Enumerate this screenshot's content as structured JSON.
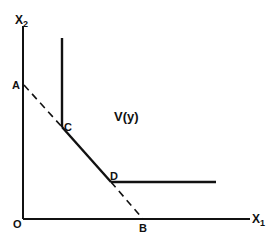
{
  "diagram": {
    "type": "isoquant",
    "colors": {
      "ink": "#111111",
      "background": "#ffffff"
    },
    "axes": {
      "x_label": "X",
      "x_sub": "1",
      "y_label": "X",
      "y_sub": "2",
      "origin_label": "O"
    },
    "points": {
      "A": "A",
      "B": "B",
      "C": "C",
      "D": "D"
    },
    "region_label": "V(y)",
    "edges": [
      {
        "from": "A",
        "to": "C",
        "style": "dashed"
      },
      {
        "from": "C",
        "to": "D",
        "style": "solid"
      },
      {
        "from": "D",
        "to": "B",
        "style": "dashed"
      },
      {
        "from": "C",
        "to": "vertical-up",
        "style": "solid"
      },
      {
        "from": "D",
        "to": "horizontal-right",
        "style": "solid"
      }
    ]
  }
}
